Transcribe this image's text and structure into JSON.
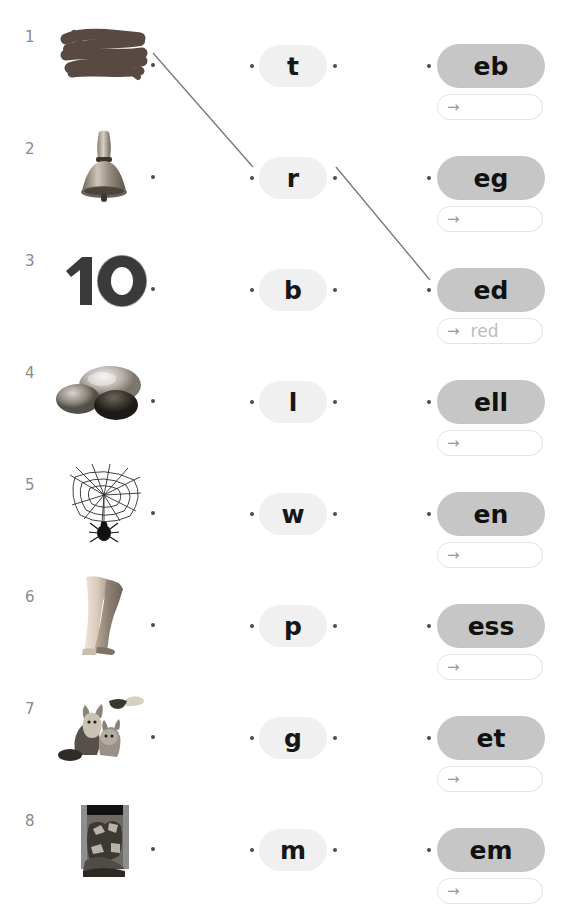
{
  "worksheet": {
    "answer_arrow_glyph": "→",
    "colors": {
      "ending_pill_bg": "#c6c6c6",
      "letter_pill_bg": "#f0f0f0",
      "dot": "#4d4d4d",
      "answer_border": "#e2e2e2",
      "answer_text": "#bdbdbd",
      "row_number": "#8a8a8a",
      "connector_line": "#7a7a7a",
      "page_bg": "#ffffff"
    },
    "rows": [
      {
        "number": "1",
        "picture": "scribble-photo",
        "picture_alt": "dark brown paint scribble",
        "letter": "t",
        "ending": "eb",
        "answer": ""
      },
      {
        "number": "2",
        "picture": "hand-bell-photo",
        "picture_alt": "metal hand bell",
        "letter": "r",
        "ending": "eg",
        "answer": ""
      },
      {
        "number": "3",
        "picture": "number-ten-photo",
        "picture_alt": "the numeral 10",
        "letter": "b",
        "ending": "ed",
        "answer": "red"
      },
      {
        "number": "4",
        "picture": "shells-photo",
        "picture_alt": "glossy shells",
        "letter": "l",
        "ending": "ell",
        "answer": ""
      },
      {
        "number": "5",
        "picture": "spider-web-photo",
        "picture_alt": "spider web with spider",
        "letter": "w",
        "ending": "en",
        "answer": ""
      },
      {
        "number": "6",
        "picture": "legs-photo",
        "picture_alt": "pair of legs",
        "letter": "p",
        "ending": "ess",
        "answer": ""
      },
      {
        "number": "7",
        "picture": "pets-photo",
        "picture_alt": "cat and dog being fed",
        "letter": "g",
        "ending": "et",
        "answer": ""
      },
      {
        "number": "8",
        "picture": "messy-bin-photo",
        "picture_alt": "overflowing rubbish bin",
        "letter": "m",
        "ending": "em",
        "answer": ""
      }
    ],
    "connections": [
      {
        "from": "row-1-picture-dot",
        "to": "row-2-letter-left-dot",
        "x1": 153,
        "y1": 53,
        "x2": 253,
        "y2": 167
      },
      {
        "from": "row-2-letter-right-dot",
        "to": "row-3-ending-dot",
        "x1": 336,
        "y1": 167,
        "x2": 430,
        "y2": 280
      }
    ]
  }
}
